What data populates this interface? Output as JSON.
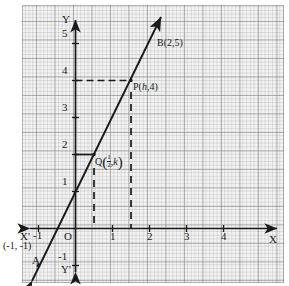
{
  "figure": {
    "kind": "coordinate-geometry-graph",
    "paper": "graph-paper-grid"
  },
  "axes": {
    "x_label_right": "X",
    "x_label_left": "X'",
    "y_label_top": "Y",
    "y_label_bottom": "Y'",
    "origin_label": "O",
    "x_ticks": [
      "-1",
      "1",
      "2",
      "3",
      "4"
    ],
    "y_ticks": [
      "5",
      "4",
      "3",
      "2",
      "1",
      "-1"
    ],
    "x_range": [
      -1.6,
      5.2
    ],
    "y_range": [
      -1.6,
      5.6
    ],
    "unit_px": 37
  },
  "points": {
    "A": {
      "label": "A",
      "coord_text": "(-1, -1)",
      "x": -1,
      "y": -1
    },
    "B": {
      "label": "B(2,5)",
      "x": 2,
      "y": 5
    },
    "P": {
      "label_prefix": "P(",
      "label_var": "h",
      "label_suffix": ",4)",
      "x": 1.5,
      "y": 4
    },
    "Q": {
      "label_prefix": "Q",
      "frac_num": "1",
      "frac_den": "2",
      "label_var": "k",
      "comma": ",",
      "x": 0.5,
      "y": 2
    }
  },
  "line": {
    "through": [
      "A(-1,-1)",
      "B(2,5)"
    ],
    "arrow_both_ends": "true"
  },
  "guides": {
    "horizontal_at_y4": "dashed from y-axis to P",
    "horizontal_at_y2": "solid from y-axis to Q",
    "vertical_at_x_half": "dashed from Q down to x-axis",
    "vertical_at_x_1_5": "dashed from P down to x-axis"
  },
  "colors": {
    "ink": "#1a1a1a",
    "grid_major": "#787a80",
    "grid_minor": "#9b9ba0",
    "paper": "#f2f2f2"
  }
}
